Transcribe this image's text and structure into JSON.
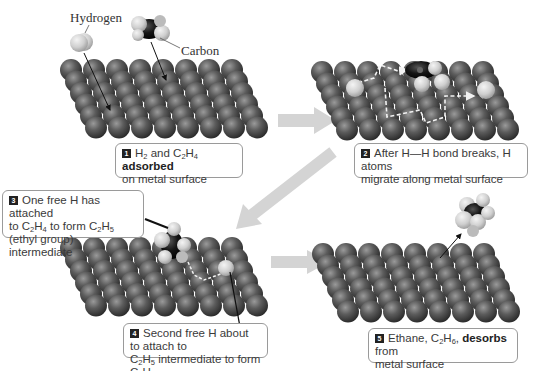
{
  "figure": {
    "labels": {
      "hydrogen": "Hydrogen",
      "carbon": "Carbon"
    },
    "colors": {
      "metal_atom": "#555555",
      "hydrogen_atom": "#d8d8d8",
      "carbon_atom": "#111111",
      "flow_arrow": "#cfcfcf",
      "caption_border": "#9a9a9a",
      "badge": "#222222"
    },
    "surface": {
      "columns": 8,
      "rows": 6
    },
    "steps": [
      {
        "number": "1",
        "parts": [
          {
            "t": "H"
          },
          {
            "sub": "2"
          },
          {
            "t": " and C"
          },
          {
            "sub": "2"
          },
          {
            "t": "H"
          },
          {
            "sub": "4"
          },
          {
            "t": " "
          },
          {
            "b": "adsorbed"
          },
          {
            "br": true
          },
          {
            "t": "on metal surface"
          }
        ],
        "text": "H2 and C2H4 adsorbed on metal surface"
      },
      {
        "number": "2",
        "parts": [
          {
            "t": "After H—H bond breaks, H atoms"
          },
          {
            "br": true
          },
          {
            "t": "migrate along metal surface"
          }
        ],
        "text": "After H—H bond breaks, H atoms migrate along metal surface"
      },
      {
        "number": "3",
        "parts": [
          {
            "t": "One free H has attached"
          },
          {
            "br": true
          },
          {
            "t": "to C"
          },
          {
            "sub": "2"
          },
          {
            "t": "H"
          },
          {
            "sub": "4"
          },
          {
            "t": " to form C"
          },
          {
            "sub": "2"
          },
          {
            "t": "H"
          },
          {
            "sub": "5"
          },
          {
            "br": true
          },
          {
            "t": "(ethyl group) intermediate"
          }
        ],
        "text": "One free H has attached to C2H4 to form C2H5 (ethyl group) intermediate"
      },
      {
        "number": "4",
        "parts": [
          {
            "t": "Second free H about to attach to"
          },
          {
            "br": true
          },
          {
            "t": "C"
          },
          {
            "sub": "2"
          },
          {
            "t": "H"
          },
          {
            "sub": "5"
          },
          {
            "t": " intermediate to form C"
          },
          {
            "sub": "2"
          },
          {
            "t": "H"
          },
          {
            "sub": "6"
          }
        ],
        "text": "Second free H about to attach to C2H5 intermediate to form C2H6"
      },
      {
        "number": "5",
        "parts": [
          {
            "t": "Ethane, C"
          },
          {
            "sub": "2"
          },
          {
            "t": "H"
          },
          {
            "sub": "6"
          },
          {
            "t": ", "
          },
          {
            "b": "desorbs"
          },
          {
            "t": " from"
          },
          {
            "br": true
          },
          {
            "t": "metal surface"
          }
        ],
        "text": "Ethane, C2H6, desorbs from metal surface"
      }
    ]
  }
}
